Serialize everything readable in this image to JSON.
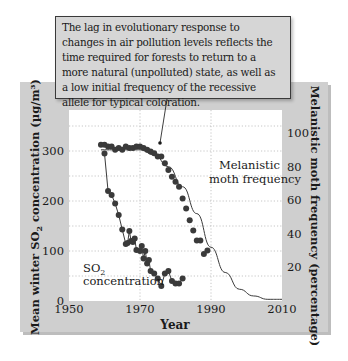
{
  "callout": {
    "text": "The lag in evolutionary response to changes in air pollution levels reflects the time required for forests to return to a more natural (unpolluted) state, as well as a low initial frequency of the recessive allele for typical coloration."
  },
  "colors": {
    "panel": "#cfcfcf",
    "plot_bg": "#ffffff",
    "points": "#3a3a3a",
    "curve": "#3a3a3a",
    "grid": "#b8b8b8"
  },
  "chart_data": {
    "type": "scatter",
    "title": "",
    "xlabel": "Year",
    "ylabel": "Mean winter SO2 concentration (µg/m³)",
    "ylabel_right": "Melanistic moth frequency (percentage)",
    "xlim": [
      1950,
      2010
    ],
    "ylim": [
      0,
      350
    ],
    "ylim_right": [
      0,
      100
    ],
    "x_ticks": [
      "1950",
      "1970",
      "1990",
      "2010"
    ],
    "y_ticks": [
      "0",
      "100",
      "200",
      "300"
    ],
    "y_ticks_right": [
      "20",
      "40",
      "60",
      "80",
      "100"
    ],
    "grid": true,
    "annotations": [
      "Melanistic moth frequency",
      "SO2 concentration"
    ],
    "series": [
      {
        "name": "Melanistic moth frequency",
        "axis": "right",
        "style": "points",
        "x": [
          1959,
          1960,
          1961,
          1962,
          1963,
          1964,
          1965,
          1966,
          1967,
          1968,
          1969,
          1970,
          1971,
          1972,
          1973,
          1974,
          1975,
          1976,
          1977,
          1978,
          1979,
          1980,
          1981,
          1982,
          1983,
          1984,
          1985,
          1986,
          1987,
          1988,
          1989
        ],
        "values": [
          93,
          93,
          92,
          92,
          90,
          91,
          90,
          92,
          91,
          91,
          92,
          92,
          91,
          90,
          89,
          88,
          86,
          86,
          82,
          78,
          74,
          71,
          68,
          61,
          55,
          48,
          42,
          36,
          36,
          28,
          30
        ]
      },
      {
        "name": "Melanistic frequency trend",
        "axis": "right",
        "style": "curve",
        "x": [
          1959,
          1965,
          1970,
          1974,
          1978,
          1982,
          1986,
          1990,
          1994,
          1998,
          2002,
          2006,
          2010
        ],
        "values": [
          90,
          90,
          90,
          87,
          80,
          68,
          52,
          32,
          17,
          7,
          3,
          1,
          1
        ]
      },
      {
        "name": "SO2 concentration",
        "axis": "left",
        "style": "points-connected",
        "x": [
          1960,
          1961,
          1962,
          1963,
          1964,
          1965,
          1966,
          1966.5,
          1967,
          1967.5,
          1968,
          1968.5,
          1969,
          1970,
          1970.5,
          1971,
          1971.5,
          1972,
          1972.5,
          1973,
          1974,
          1975,
          1976,
          1977,
          1978,
          1979,
          1980,
          1981,
          1982
        ],
        "values": [
          295,
          220,
          212,
          195,
          172,
          143,
          114,
          116,
          140,
          120,
          118,
          125,
          102,
          100,
          110,
          85,
          100,
          75,
          82,
          60,
          55,
          45,
          30,
          55,
          60,
          40,
          35,
          35,
          45
        ]
      }
    ]
  }
}
